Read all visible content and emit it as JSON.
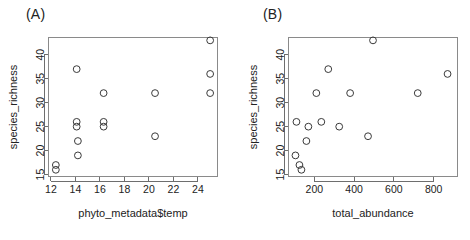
{
  "figure": {
    "panels": [
      {
        "label": "(A)",
        "name": "panel-a"
      },
      {
        "label": "(B)",
        "name": "panel-b"
      }
    ]
  },
  "chart_data": [
    {
      "type": "scatter",
      "title": "(A)",
      "xlabel": "phyto_metadata$temp",
      "ylabel": "species_richness",
      "xlim": [
        11.8,
        25.6
      ],
      "ylim": [
        14.6,
        43.6
      ],
      "xticks": [
        12,
        14,
        16,
        18,
        20,
        22,
        24
      ],
      "yticks": [
        15,
        20,
        25,
        30,
        35,
        40
      ],
      "grid": false,
      "legend": "none",
      "marker": "open-circle",
      "points": [
        {
          "x": 12.4,
          "y": 17
        },
        {
          "x": 12.4,
          "y": 16
        },
        {
          "x": 14.1,
          "y": 37
        },
        {
          "x": 14.1,
          "y": 26
        },
        {
          "x": 14.1,
          "y": 25
        },
        {
          "x": 14.2,
          "y": 22
        },
        {
          "x": 14.2,
          "y": 19
        },
        {
          "x": 16.3,
          "y": 32
        },
        {
          "x": 16.3,
          "y": 26
        },
        {
          "x": 16.3,
          "y": 25
        },
        {
          "x": 20.5,
          "y": 32
        },
        {
          "x": 20.5,
          "y": 23
        },
        {
          "x": 25.0,
          "y": 43
        },
        {
          "x": 25.0,
          "y": 36
        },
        {
          "x": 25.0,
          "y": 32
        }
      ]
    },
    {
      "type": "scatter",
      "title": "(B)",
      "xlabel": "total_abundance",
      "ylabel": "species_richness",
      "xlim": [
        70,
        920
      ],
      "ylim": [
        14.6,
        43.6
      ],
      "xticks": [
        200,
        400,
        600,
        800
      ],
      "yticks": [
        15,
        20,
        25,
        30,
        35,
        40
      ],
      "grid": false,
      "legend": "none",
      "marker": "open-circle",
      "points": [
        {
          "x": 110,
          "y": 26
        },
        {
          "x": 105,
          "y": 19
        },
        {
          "x": 125,
          "y": 17
        },
        {
          "x": 135,
          "y": 16
        },
        {
          "x": 160,
          "y": 22
        },
        {
          "x": 170,
          "y": 25
        },
        {
          "x": 210,
          "y": 32
        },
        {
          "x": 235,
          "y": 26
        },
        {
          "x": 270,
          "y": 37
        },
        {
          "x": 325,
          "y": 25
        },
        {
          "x": 380,
          "y": 32
        },
        {
          "x": 470,
          "y": 23
        },
        {
          "x": 495,
          "y": 43
        },
        {
          "x": 720,
          "y": 32
        },
        {
          "x": 870,
          "y": 36
        }
      ]
    }
  ]
}
